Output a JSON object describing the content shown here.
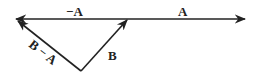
{
  "diagram": {
    "labels": {
      "neg_a": "−A",
      "a": "A",
      "b": "B",
      "b_minus_a": "B − A"
    },
    "colors": {
      "stroke": "#222222",
      "background": "#ffffff"
    }
  }
}
